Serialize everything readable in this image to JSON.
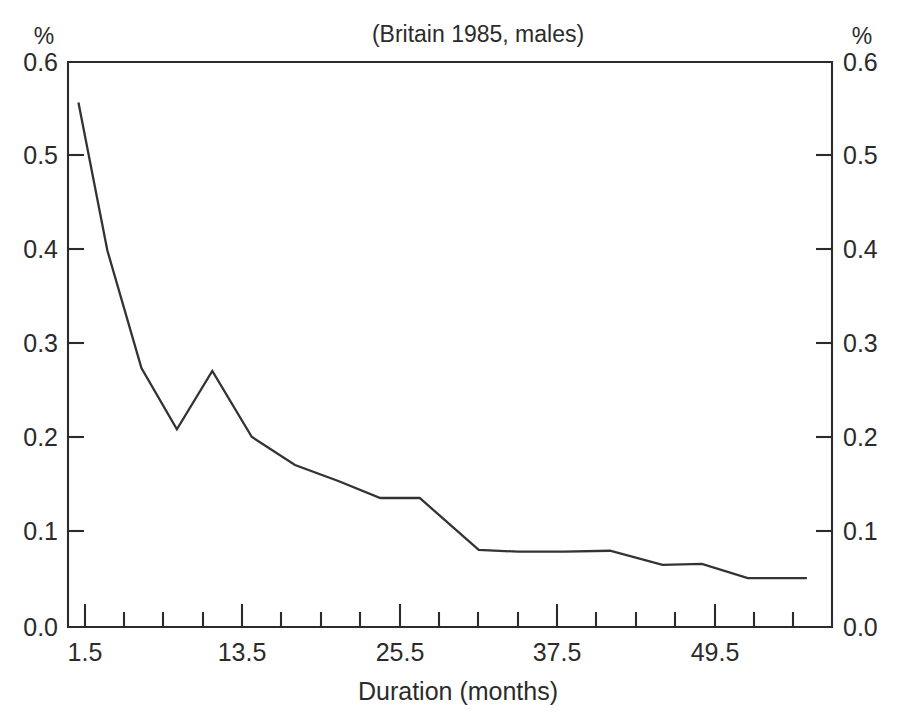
{
  "figure": {
    "title": "(Britain 1985, males)",
    "left_unit": "%",
    "right_unit": "%",
    "xlabel": "Duration (months)"
  },
  "axes": {
    "y_tick_labels": [
      "0.6",
      "0.5",
      "0.4",
      "0.3",
      "0.2",
      "0.1",
      "0.0"
    ],
    "y_tick_labels_right": [
      "0.6",
      "0.5",
      "0.4",
      "0.3",
      "0.2",
      "0.1",
      "0.0"
    ],
    "x_tick_labels": [
      "1.5",
      "13.5",
      "25.5",
      "37.5",
      "49.5"
    ]
  },
  "chart_data": {
    "type": "line",
    "title": "(Britain 1985, males)",
    "xlabel": "Duration (months)",
    "ylabel": "%",
    "ylabel_right": "%",
    "xlim": [
      0.4,
      58.5
    ],
    "ylim": [
      0.0,
      0.6
    ],
    "yticks": [
      0.0,
      0.1,
      0.2,
      0.3,
      0.4,
      0.5,
      0.6
    ],
    "ytick_labels": [
      "0.0",
      "0.1",
      "0.2",
      "0.3",
      "0.4",
      "0.5",
      "0.6"
    ],
    "xticks_labeled": [
      1.5,
      13.5,
      25.5,
      37.5,
      49.5
    ],
    "xtick_labels": [
      "1.5",
      "13.5",
      "25.5",
      "37.5",
      "49.5"
    ],
    "xticks_minor_step": 3,
    "grid": false,
    "legend": null,
    "series": [
      {
        "name": "Escape rate",
        "x": [
          1.0,
          3.2,
          5.8,
          8.5,
          11.2,
          14.2,
          17.5,
          20.8,
          24.0,
          27.0,
          31.5,
          34.5,
          38.0,
          41.5,
          45.5,
          48.5,
          52.0,
          56.5
        ],
        "y": [
          0.557,
          0.4,
          0.275,
          0.21,
          0.272,
          0.202,
          0.172,
          0.155,
          0.137,
          0.137,
          0.082,
          0.08,
          0.08,
          0.081,
          0.066,
          0.067,
          0.052,
          0.052
        ]
      }
    ]
  }
}
